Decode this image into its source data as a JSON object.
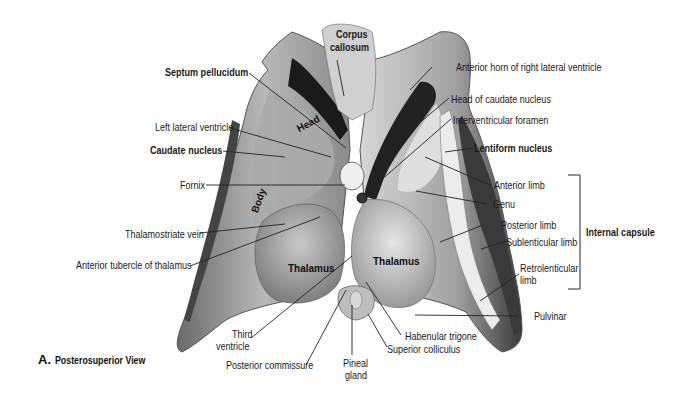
{
  "figure": {
    "caption_letter": "A.",
    "caption_title": "Posterosuperior View"
  },
  "labels": {
    "corpus_callosum_1": "Corpus",
    "corpus_callosum_2": "callosum",
    "septum_pellucidum": "Septum pellucidum",
    "anterior_horn": "Anterior horn of right lateral ventricle",
    "head_of_caudate": "Head of caudate nucleus",
    "left_lateral_ventricle": "Left lateral ventricle",
    "interventricular_foramen": "Interventricular foramen",
    "caudate_nucleus": "Caudate nucleus",
    "lentiform_nucleus": "Lentiform nucleus",
    "fornix": "Fornix",
    "anterior_limb": "Anterior limb",
    "genu": "Genu",
    "posterior_limb": "Posterior limb",
    "internal_capsule": "Internal capsule",
    "thalamostriate_vein": "Thalamostriate vein",
    "sublenticular_limb": "Sublenticular limb",
    "anterior_tubercle": "Anterior tubercle of thalamus",
    "retrolenticular_1": "Retrolenticular",
    "retrolenticular_2": "limb",
    "pulvinar": "Pulvinar",
    "third_ventricle_1": "Third",
    "third_ventricle_2": "ventricle",
    "habenular_trigone": "Habenular trigone",
    "superior_colliculus": "Superior colliculus",
    "posterior_commissure": "Posterior commissure",
    "pineal_1": "Pineal",
    "pineal_2": "gland"
  },
  "inner_labels": {
    "head": "Head",
    "body": "Body",
    "thalamus_left": "Thalamus",
    "thalamus_right": "Thalamus"
  },
  "colors": {
    "background": "#ffffff",
    "text": "#1a1a1a",
    "leader": "#222222"
  }
}
